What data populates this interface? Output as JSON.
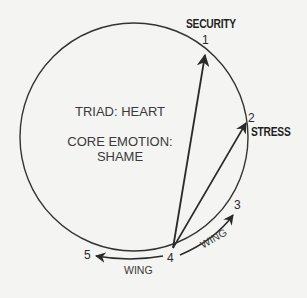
{
  "diagram": {
    "type": "enneagram-type-diagram",
    "triad_label": "TRIAD: HEART",
    "core_emotion_label": "CORE EMOTION:",
    "core_emotion_value": "SHAME",
    "points": [
      {
        "number": "1",
        "label": "SECURITY"
      },
      {
        "number": "2",
        "label": "STRESS"
      },
      {
        "number": "3",
        "label": ""
      },
      {
        "number": "4",
        "label": ""
      },
      {
        "number": "5",
        "label": ""
      }
    ],
    "wing_left_label": "WING",
    "wing_right_label": "WING",
    "arrows": [
      {
        "from": "4",
        "to": "1",
        "meaning": "SECURITY"
      },
      {
        "from": "4",
        "to": "2",
        "meaning": "STRESS"
      },
      {
        "from": "4",
        "to": "3",
        "meaning": "WING"
      },
      {
        "from": "4",
        "to": "5",
        "meaning": "WING"
      }
    ],
    "colors": {
      "background": "#f4f4f2",
      "ink": "#2a2a2a"
    }
  }
}
